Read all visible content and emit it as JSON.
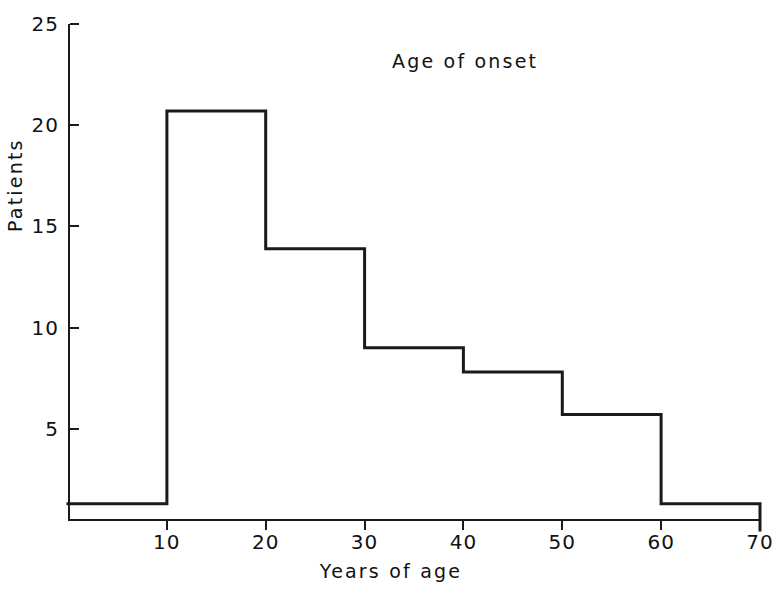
{
  "chart_data": {
    "type": "bar",
    "title": "Age of onset",
    "xlabel": "Years of age",
    "ylabel": "Patients",
    "grid": false,
    "legend": false,
    "style": "step-outline histogram (unfilled outline)",
    "line_color": "#1a1a1a",
    "background_color": "#ffffff",
    "xlim": [
      0,
      70
    ],
    "ylim": [
      0,
      25
    ],
    "x_tick_labels": [
      "10",
      "20",
      "30",
      "40",
      "50",
      "60",
      "70"
    ],
    "x_ticks": [
      10,
      20,
      30,
      40,
      50,
      60,
      70
    ],
    "y_tick_labels": [
      "5",
      "10",
      "15",
      "20",
      "25"
    ],
    "y_ticks": [
      5,
      10,
      15,
      20,
      25
    ],
    "bin_edges": [
      0,
      10,
      20,
      30,
      40,
      50,
      60,
      70
    ],
    "categories": [
      "0-10",
      "10-20",
      "20-30",
      "30-40",
      "40-50",
      "50-60",
      "60-70"
    ],
    "values": [
      1.3,
      20.7,
      13.9,
      9.0,
      7.8,
      5.7,
      1.3
    ]
  },
  "labels": {
    "title": "Age of onset",
    "x_axis": "Years of age",
    "y_axis": "Patients"
  }
}
